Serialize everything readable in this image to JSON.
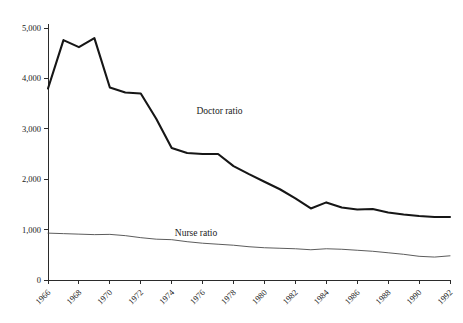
{
  "chart_data": {
    "type": "line",
    "title": "",
    "subtitle": "",
    "xlabel": "",
    "ylabel": "",
    "xlim": [
      1966,
      1992
    ],
    "ylim": [
      0,
      5000
    ],
    "grid": false,
    "legend_position": "inline-annotation",
    "y_ticks": [
      0,
      1000,
      2000,
      3000,
      4000,
      5000
    ],
    "y_tick_labels": [
      "0",
      "1,000",
      "2,000",
      "3,000",
      "4,000",
      "5,000"
    ],
    "x_ticks": [
      1966,
      1968,
      1970,
      1972,
      1974,
      1976,
      1978,
      1980,
      1982,
      1984,
      1986,
      1988,
      1990,
      1992
    ],
    "x_tick_labels": [
      "1966",
      "1968",
      "1970",
      "1972",
      "1974",
      "1976",
      "1978",
      "1980",
      "1982",
      "1984",
      "1986",
      "1988",
      "1990",
      "1992"
    ],
    "x": [
      1966,
      1967,
      1968,
      1969,
      1970,
      1971,
      1972,
      1973,
      1974,
      1975,
      1976,
      1977,
      1978,
      1979,
      1980,
      1981,
      1982,
      1983,
      1984,
      1985,
      1986,
      1987,
      1988,
      1989,
      1990,
      1991,
      1992
    ],
    "series": [
      {
        "name": "Doctor ratio",
        "color": "#161616",
        "label_x": 1975.6,
        "label_y": 3300,
        "values": [
          3800,
          4760,
          4620,
          4800,
          3820,
          3720,
          3700,
          3200,
          2620,
          2520,
          2500,
          2500,
          2260,
          2100,
          1950,
          1800,
          1620,
          1420,
          1540,
          1440,
          1400,
          1410,
          1340,
          1300,
          1270,
          1250,
          1250
        ]
      },
      {
        "name": "Nurse ratio",
        "color": "#4a4a4a",
        "label_x": 1974.2,
        "label_y": 870,
        "values": [
          930,
          920,
          910,
          900,
          905,
          880,
          840,
          810,
          800,
          760,
          730,
          710,
          690,
          660,
          640,
          630,
          620,
          600,
          620,
          610,
          590,
          570,
          540,
          510,
          470,
          455,
          480
        ]
      }
    ]
  }
}
